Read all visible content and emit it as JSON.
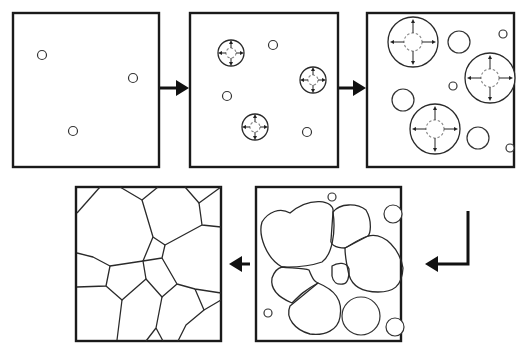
{
  "diagram": {
    "stages": [
      {
        "id": 1,
        "label": "nucleation-sites",
        "nuclei": [
          [
            42,
            55
          ],
          [
            133,
            78
          ],
          [
            73,
            131
          ]
        ]
      },
      {
        "id": 2,
        "label": "early-growth",
        "growing": [
          [
            231,
            52,
            13
          ],
          [
            313,
            80,
            13
          ],
          [
            255,
            127,
            13
          ]
        ],
        "nuclei": [
          [
            273,
            45
          ],
          [
            227,
            96
          ],
          [
            307,
            132
          ]
        ]
      },
      {
        "id": 3,
        "label": "grain-growth",
        "growing": [
          [
            413,
            42,
            25
          ],
          [
            488,
            78,
            25
          ],
          [
            435,
            128,
            25
          ]
        ],
        "nuclei": [
          [
            459,
            42,
            11
          ],
          [
            503,
            33,
            4
          ],
          [
            453,
            85,
            4
          ],
          [
            403,
            99,
            11
          ],
          [
            477,
            138,
            11
          ],
          [
            509,
            148,
            4
          ]
        ]
      },
      {
        "id": 4,
        "label": "impingement",
        "small_circles": [
          [
            331,
            197
          ],
          [
            394,
            214,
            9
          ],
          [
            268,
            313
          ],
          [
            361,
            317,
            18
          ],
          [
            396,
            327,
            9
          ]
        ]
      },
      {
        "id": 5,
        "label": "fully-recrystallized-microstructure"
      }
    ],
    "flow_arrows": [
      {
        "from": 1,
        "to": 2,
        "direction": "right"
      },
      {
        "from": 2,
        "to": 3,
        "direction": "right"
      },
      {
        "from": 3,
        "to": 4,
        "direction": "down-left"
      },
      {
        "from": 4,
        "to": 5,
        "direction": "left"
      }
    ],
    "colors": {
      "line": "#1a1a1a",
      "dashed_nucleus": "#888888",
      "background": "#ffffff"
    }
  }
}
